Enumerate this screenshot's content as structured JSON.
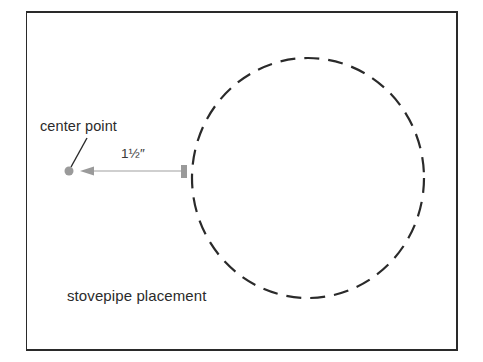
{
  "diagram": {
    "labels": {
      "center_point": "center point",
      "measurement": "1½″",
      "stovepipe": "stovepipe placement"
    },
    "colors": {
      "frame": "#2a2a2a",
      "circle_dash": "#2a2a2a",
      "marker_gray": "#9a9a9a",
      "text": "#2b2b2b"
    },
    "elements": {
      "circle": {
        "cx": 308,
        "cy": 178,
        "r": 118,
        "style": "dashed"
      },
      "center_dot": {
        "cx": 69,
        "cy": 171,
        "r": 4.5
      },
      "arrow": {
        "from_x": 181,
        "to_x": 80,
        "y": 171
      },
      "edge_marker": {
        "x": 181,
        "y": 165,
        "w": 6,
        "h": 13
      }
    }
  }
}
